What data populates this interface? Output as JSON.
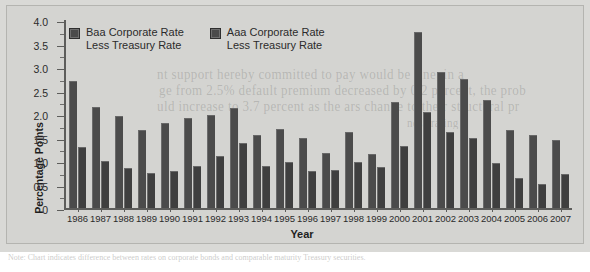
{
  "chart_data": {
    "type": "bar",
    "title": "",
    "xlabel": "Year",
    "ylabel": "Percentage Points",
    "ylim": [
      0,
      4.0
    ],
    "ytick_labels": [
      "4.0",
      "3.5",
      "3.0",
      "2.5",
      "2.0",
      "1.5",
      "1.0",
      "0.5",
      "0"
    ],
    "ytick_values": [
      4.0,
      3.5,
      3.0,
      2.5,
      2.0,
      1.5,
      1.0,
      0.5,
      0
    ],
    "grid": false,
    "legend_position": "top-left",
    "categories": [
      "1986",
      "1987",
      "1988",
      "1989",
      "1990",
      "1991",
      "1992",
      "1993",
      "1994",
      "1995",
      "1996",
      "1997",
      "1998",
      "1999",
      "2000",
      "2001",
      "2002",
      "2003",
      "2004",
      "2005",
      "2006",
      "2007"
    ],
    "series": [
      {
        "name": "Baa Corporate Rate Less Treasury Rate",
        "color": "#4b4b4b",
        "values": [
          2.7,
          2.15,
          1.95,
          1.65,
          1.8,
          1.92,
          1.97,
          2.12,
          1.55,
          1.68,
          1.48,
          1.18,
          1.62,
          1.15,
          2.25,
          3.75,
          2.9,
          2.75,
          2.3,
          1.65,
          1.55,
          1.45
        ]
      },
      {
        "name": "Aaa Corporate Rate Less Treasury Rate",
        "color": "#3f3f3f",
        "values": [
          1.3,
          1.0,
          0.85,
          0.75,
          0.78,
          0.9,
          1.1,
          1.38,
          0.9,
          0.97,
          0.78,
          0.8,
          0.97,
          0.87,
          1.32,
          2.05,
          1.62,
          1.48,
          0.95,
          0.63,
          0.52,
          0.72
        ]
      }
    ]
  },
  "legend": {
    "items": [
      {
        "line1": "Baa Corporate Rate",
        "line2": "Less Treasury Rate"
      },
      {
        "line1": "Aaa Corporate Rate",
        "line2": "Less Treasury Rate"
      }
    ]
  },
  "ghost_text": {
    "line1": "nt support hereby committed to pay would be fine, in a",
    "line2": "ge from 2.5% default premium decreased by 0.2 percent, the prob",
    "line3": "uld increase to 3.7 percent as the ars change to their structural pr",
    "line4": "ness rating",
    "bottom": "Note: Chart indicates difference between rates on corporate bonds and comparable maturity Treasury securities."
  }
}
